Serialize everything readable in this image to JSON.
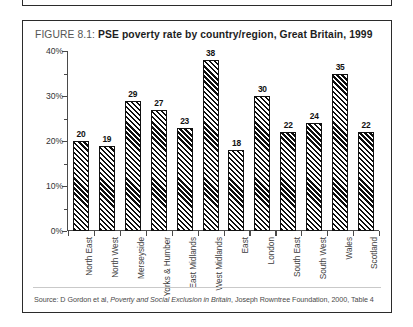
{
  "figure": {
    "number_label": "FIGURE 8.1:",
    "caption": "PSE poverty rate by country/region, Great Britain, 1999",
    "source": "Source: D Gordon et al, Poverty and Social Exclusion in Britain, Joseph Rowntree Foundation, 2000, Table 4",
    "source_parts": {
      "prefix": "Source: D Gordon et al, ",
      "italic_title": "Poverty and Social Exclusion in Britain",
      "suffix": ", Joseph Rowntree Foundation, 2000, Table 4"
    }
  },
  "chart_data": {
    "type": "bar",
    "title": "PSE poverty rate by country/region, Great Britain, 1999",
    "xlabel": "",
    "ylabel": "",
    "ylim": [
      0,
      40
    ],
    "ytick_labels": [
      "0%",
      "10%",
      "20%",
      "30%",
      "40%"
    ],
    "ytick_values": [
      0,
      10,
      20,
      30,
      40
    ],
    "yminor_values": [
      5,
      15,
      25,
      35
    ],
    "grid": false,
    "legend": false,
    "value_labels": true,
    "bar_fill": "diagonal-hatch",
    "categories": [
      "North East",
      "North West",
      "Merseyside",
      "Yorks & Humber",
      "East Midlands",
      "West Midlands",
      "East",
      "London",
      "South East",
      "South West",
      "Wales",
      "Scotland"
    ],
    "values": [
      20,
      19,
      29,
      27,
      23,
      38,
      18,
      30,
      22,
      24,
      35,
      22
    ]
  },
  "colors": {
    "border": "#2b2b2b",
    "bar_outline": "#111111",
    "axis": "#4a4a4a",
    "text": "#3a3a3a"
  }
}
